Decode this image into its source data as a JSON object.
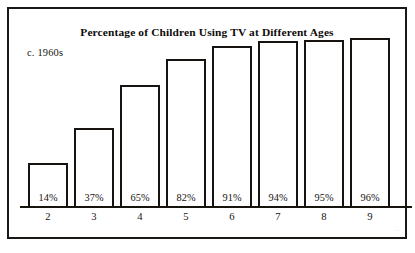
{
  "figure": {
    "title": "Percentage of Children Using TV at Different Ages",
    "era_note": "c. 1960s",
    "artifact_mark": "''"
  },
  "chart_data": {
    "type": "bar",
    "title": "Percentage of Children Using TV at Different Ages",
    "subtitle": "c. 1960s",
    "xlabel": "",
    "ylabel": "",
    "ylim": [
      0,
      100
    ],
    "grid": false,
    "legend": null,
    "categories": [
      "2",
      "3",
      "4",
      "5",
      "6",
      "7",
      "8",
      "9"
    ],
    "values": [
      14,
      37,
      65,
      82,
      91,
      94,
      95,
      96
    ],
    "value_labels": [
      "14%",
      "37%",
      "65%",
      "82%",
      "91%",
      "94%",
      "95%",
      "96%"
    ],
    "bars": [
      {
        "category": "2",
        "value": 14,
        "label": "14%"
      },
      {
        "category": "3",
        "value": 37,
        "label": "37%"
      },
      {
        "category": "4",
        "value": 65,
        "label": "65%"
      },
      {
        "category": "5",
        "value": 82,
        "label": "82%"
      },
      {
        "category": "6",
        "value": 91,
        "label": "91%"
      },
      {
        "category": "7",
        "value": 94,
        "label": "94%"
      },
      {
        "category": "8",
        "value": 95,
        "label": "95%"
      },
      {
        "category": "9",
        "value": 96,
        "label": "96%"
      }
    ],
    "colors": {
      "bar_fill": "#ffffff",
      "bar_outline": "#171310",
      "axis": "#17130f",
      "text": "#15120f",
      "background": "#ffffff"
    }
  }
}
